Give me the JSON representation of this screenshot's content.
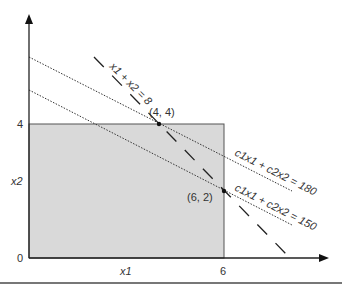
{
  "figure": {
    "type": "linear-programming-feasible-region",
    "axes": {
      "x_label": "x1",
      "y_label": "x2",
      "origin_label": "0",
      "x_tick_label": "6",
      "y_tick_label": "4"
    },
    "feasible_region": {
      "x_range": [
        0,
        6
      ],
      "y_range": [
        0,
        4
      ],
      "fill": "#d9d9d9",
      "stroke": "#555555"
    },
    "constraint_line": {
      "label": "x1 + x2 = 8",
      "style": "dashed"
    },
    "objective_lines": [
      {
        "label": "c1x1 + c2x2 = 180",
        "style": "dotted"
      },
      {
        "label": "c1x1 + c2x2 = 150",
        "style": "dotted"
      }
    ],
    "points": [
      {
        "label": "(4, 4)",
        "x": 4,
        "y": 4
      },
      {
        "label": "(6, 2)",
        "x": 6,
        "y": 2
      }
    ],
    "colors": {
      "axis": "#222222",
      "text": "#333333",
      "region_fill": "#d9d9d9",
      "bottom_rule": "#777777"
    }
  }
}
